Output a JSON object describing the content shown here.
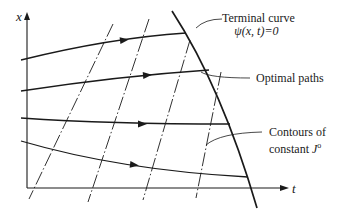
{
  "diagram": {
    "axes": {
      "x_label": "x",
      "t_label": "t"
    },
    "labels": {
      "terminal_curve_line1": "Terminal curve",
      "terminal_curve_line2": "ψ(x, t)=0",
      "optimal_paths": "Optimal paths",
      "contours_line1": "Contours of",
      "contours_line2_prefix": "constant ",
      "contours_line2_symbol": "J",
      "contours_line2_superscript": "o"
    },
    "colors": {
      "ink": "#1a1a1a",
      "background": "#ffffff"
    },
    "elements": {
      "optimal_path_count": 4,
      "contour_count": 4
    }
  }
}
